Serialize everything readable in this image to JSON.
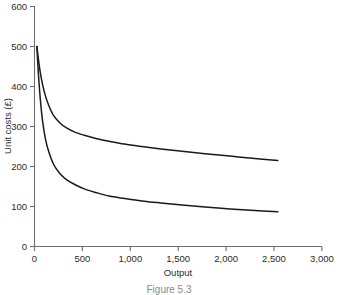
{
  "chart_data": {
    "type": "line",
    "title": "",
    "xlabel": "Output",
    "ylabel": "Unit costs (£)",
    "xlim": [
      0,
      3000
    ],
    "ylim": [
      0,
      600
    ],
    "grid": false,
    "legend": "none",
    "x_ticks": [
      0,
      500,
      1000,
      1500,
      2000,
      2500,
      3000
    ],
    "x_tick_labels": [
      "0",
      "500",
      "1,000",
      "1,500",
      "2,000",
      "2,500",
      "3,000"
    ],
    "y_ticks": [
      0,
      100,
      200,
      300,
      400,
      500,
      600
    ],
    "y_tick_labels": [
      "0",
      "100",
      "200",
      "300",
      "400",
      "500",
      "600"
    ],
    "series": [
      {
        "name": "upper-unit-cost-curve",
        "color": "#1a1a1a",
        "x": [
          25,
          40,
          60,
          85,
          115,
          150,
          200,
          260,
          330,
          420,
          520,
          640,
          780,
          940,
          1120,
          1320,
          1540,
          1780,
          2040,
          2300,
          2540
        ],
        "values": [
          500,
          470,
          436,
          404,
          376,
          352,
          327,
          310,
          297,
          286,
          278,
          270,
          263,
          256,
          250,
          244,
          238,
          232,
          226,
          220,
          215
        ]
      },
      {
        "name": "lower-unit-cost-curve",
        "color": "#1a1a1a",
        "x": [
          25,
          40,
          60,
          85,
          115,
          150,
          200,
          260,
          330,
          420,
          520,
          640,
          780,
          940,
          1120,
          1320,
          1540,
          1780,
          2040,
          2300,
          2540
        ],
        "values": [
          500,
          435,
          370,
          312,
          268,
          236,
          205,
          184,
          168,
          155,
          144,
          135,
          126,
          120,
          114,
          109,
          104,
          99,
          94,
          90,
          87
        ]
      }
    ],
    "annotations": []
  },
  "caption": {
    "text": "Figure 5.3"
  }
}
